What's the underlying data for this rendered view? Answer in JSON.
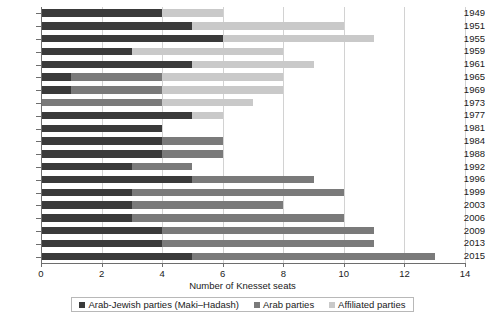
{
  "chart_data": {
    "type": "bar",
    "orientation": "horizontal",
    "stacked": true,
    "title": "",
    "xlabel": "Number of Knesset seats",
    "ylabel": "",
    "xlim": [
      0,
      14
    ],
    "xticks": [
      0,
      2,
      4,
      6,
      8,
      10,
      12,
      14
    ],
    "grid": "vertical",
    "legend_position": "bottom",
    "categories": [
      "1949",
      "1951",
      "1955",
      "1959",
      "1961",
      "1965",
      "1969",
      "1973",
      "1977",
      "1981",
      "1984",
      "1988",
      "1992",
      "1996",
      "1999",
      "2003",
      "2006",
      "2009",
      "2013",
      "2015"
    ],
    "series": [
      {
        "name": "Arab-Jewish parties (Maki–Hadash)",
        "color": "#3a3a3a",
        "values": [
          4,
          5,
          6,
          3,
          5,
          1,
          1,
          0,
          5,
          4,
          4,
          4,
          3,
          5,
          3,
          3,
          3,
          4,
          4,
          5
        ]
      },
      {
        "name": "Arab parties",
        "color": "#7a7a7a",
        "values": [
          0,
          0,
          0,
          0,
          0,
          3,
          3,
          4,
          0,
          0,
          2,
          2,
          2,
          4,
          7,
          5,
          7,
          7,
          7,
          8
        ]
      },
      {
        "name": "Affiliated parties",
        "color": "#c9c9c9",
        "values": [
          2,
          5,
          5,
          5,
          4,
          4,
          4,
          3,
          1,
          0,
          0,
          0,
          0,
          0,
          0,
          0,
          0,
          0,
          0,
          0
        ]
      }
    ],
    "totals": [
      6,
      10,
      11,
      8,
      9,
      8,
      8,
      7,
      6,
      4,
      6,
      6,
      5,
      9,
      10,
      8,
      10,
      11,
      11,
      13
    ]
  },
  "legend": {
    "items": [
      {
        "label": "Arab-Jewish parties (Maki–Hadash)",
        "color": "#3a3a3a"
      },
      {
        "label": "Arab parties",
        "color": "#7a7a7a"
      },
      {
        "label": "Affiliated parties",
        "color": "#c9c9c9"
      }
    ]
  },
  "axis": {
    "x_title": "Number of Knesset seats",
    "x_tick_labels": [
      "0",
      "2",
      "4",
      "6",
      "8",
      "10",
      "12",
      "14"
    ],
    "y_tick_labels": [
      "1949",
      "1951",
      "1955",
      "1959",
      "1961",
      "1965",
      "1969",
      "1973",
      "1977",
      "1981",
      "1984",
      "1988",
      "1992",
      "1996",
      "1999",
      "2003",
      "2006",
      "2009",
      "2013",
      "2015"
    ]
  },
  "colors": {
    "axis": "#6e6e6e",
    "grid": "#d2d2d2",
    "background": "#ffffff",
    "text": "#1a1a1a"
  }
}
